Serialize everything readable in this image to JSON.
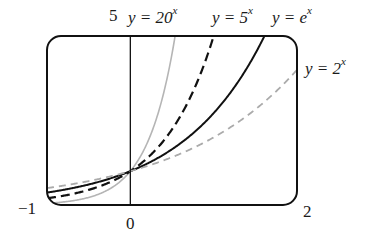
{
  "chart_data": {
    "type": "line",
    "title": "",
    "xlabel": "",
    "ylabel": "",
    "xlim": [
      -1,
      2
    ],
    "ylim": [
      0,
      5
    ],
    "grid": false,
    "tick_labels": {
      "x_left": "−1",
      "x_zero": "0",
      "x_right": "2",
      "y_top": "5"
    },
    "series": [
      {
        "name": "y = 20^x",
        "base": 20,
        "style": "solid",
        "color": "#b5b5b5",
        "width": 1.6,
        "label_prefix": "y = 20",
        "label_exp": "x"
      },
      {
        "name": "y = 5^x",
        "base": 5,
        "style": "dashed",
        "color": "#111111",
        "width": 2.2,
        "label_prefix": "y = 5",
        "label_exp": "x"
      },
      {
        "name": "y = e^x",
        "base": 2.718281828,
        "style": "solid",
        "color": "#111111",
        "width": 2.0,
        "label_prefix": "y = e",
        "label_exp": "x"
      },
      {
        "name": "y = 2^x",
        "base": 2,
        "style": "dashed",
        "color": "#ababab",
        "width": 1.8,
        "label_prefix": "y = 2",
        "label_exp": "x"
      }
    ],
    "sample_points": {
      "x": [
        -1,
        -0.5,
        0,
        0.5,
        1,
        1.5,
        2
      ],
      "y = 20^x": [
        0.05,
        0.224,
        1,
        4.472,
        null,
        null,
        null
      ],
      "y = 5^x": [
        0.2,
        0.447,
        1,
        2.236,
        5,
        null,
        null
      ],
      "y = e^x": [
        0.368,
        0.607,
        1,
        1.649,
        2.718,
        4.482,
        null
      ],
      "y = 2^x": [
        0.5,
        0.707,
        1,
        1.414,
        2,
        2.828,
        4
      ]
    }
  },
  "labels": {
    "y_top": "5",
    "x_left": "−1",
    "x_zero": "0",
    "x_right": "2",
    "curve_20": {
      "prefix": "y = 20",
      "exp": "x"
    },
    "curve_5": {
      "prefix": "y = 5",
      "exp": "x"
    },
    "curve_e": {
      "prefix": "y = e",
      "exp": "x"
    },
    "curve_2": {
      "prefix": "y = 2",
      "exp": "x"
    }
  },
  "frame": {
    "left": 47,
    "top": 36,
    "right": 297,
    "bottom": 205,
    "corner_radius": 14,
    "color": "#111111"
  }
}
